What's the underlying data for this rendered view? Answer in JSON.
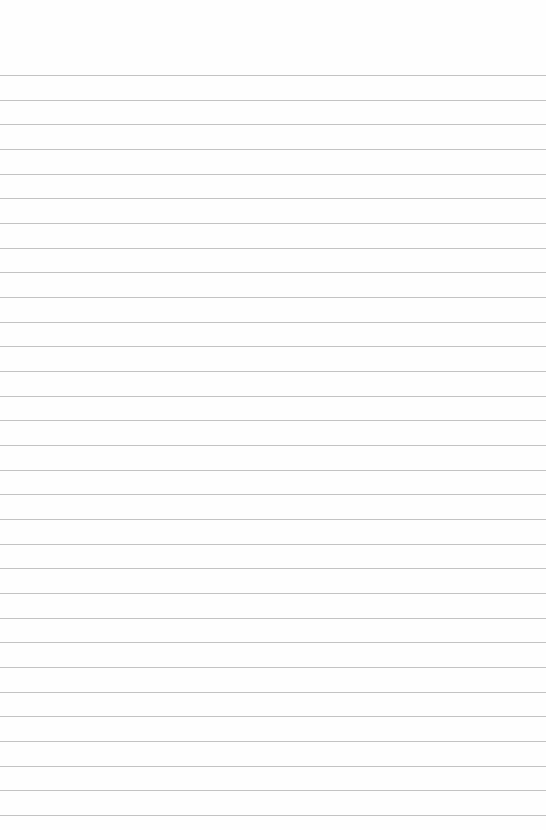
{
  "paper": {
    "type": "lined-paper",
    "background": "#fefefe",
    "line_color": "#b9b9b9",
    "first_line_y": 75,
    "line_spacing": 24.67,
    "line_count": 31
  }
}
